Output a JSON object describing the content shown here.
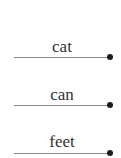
{
  "worksheet": {
    "items": [
      {
        "word": "cat"
      },
      {
        "word": "can"
      },
      {
        "word": "feet"
      }
    ],
    "colors": {
      "text": "#333333",
      "line": "#8a8a8a",
      "dot": "#1a1a1a"
    }
  }
}
